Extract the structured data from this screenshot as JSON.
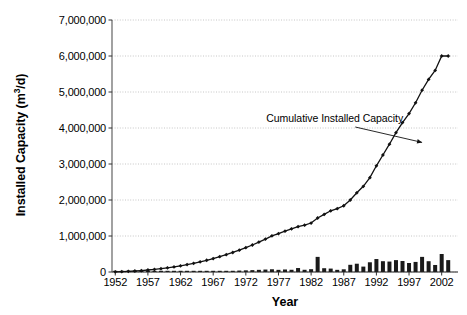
{
  "chart_data": {
    "type": "bar",
    "title": "",
    "xlabel": "Year",
    "ylabel": "Installed Capacity (m3/d)",
    "ylabel_parts": {
      "pre": "Installed Capacity (m",
      "sup": "3",
      "post": "/d)"
    },
    "ylim": [
      0,
      7000000
    ],
    "xlim": [
      1951.5,
      2004.5
    ],
    "grid": true,
    "legend_position": "none",
    "ytick_labels": [
      "0",
      "1,000,000",
      "2,000,000",
      "3,000,000",
      "4,000,000",
      "5,000,000",
      "6,000,000",
      "7,000,000"
    ],
    "ytick_values": [
      0,
      1000000,
      2000000,
      3000000,
      4000000,
      5000000,
      6000000,
      7000000
    ],
    "xtick_labels": [
      "1952",
      "1957",
      "1962",
      "1967",
      "1972",
      "1977",
      "1982",
      "1987",
      "1992",
      "1997",
      "2002"
    ],
    "xtick_values": [
      1952,
      1957,
      1962,
      1967,
      1972,
      1977,
      1982,
      1987,
      1992,
      1997,
      2002
    ],
    "annotations": [
      {
        "text": "Cumulative Installed Capacity",
        "x": 1988.0,
        "y": 4250000,
        "arrow_to_x": 1999.0,
        "arrow_to_y": 3600000
      }
    ],
    "series": [
      {
        "name": "Annual Installed Capacity",
        "type": "bar",
        "color": "#1a1a1a",
        "x": [
          1952,
          1953,
          1954,
          1955,
          1956,
          1957,
          1958,
          1959,
          1960,
          1961,
          1962,
          1963,
          1964,
          1965,
          1966,
          1967,
          1968,
          1969,
          1970,
          1971,
          1972,
          1973,
          1974,
          1975,
          1976,
          1977,
          1978,
          1979,
          1980,
          1981,
          1982,
          1983,
          1984,
          1985,
          1986,
          1987,
          1988,
          1989,
          1990,
          1991,
          1992,
          1993,
          1994,
          1995,
          1996,
          1997,
          1998,
          1999,
          2000,
          2001,
          2002,
          2003
        ],
        "values": [
          2000,
          3000,
          3000,
          4000,
          4000,
          5000,
          6000,
          6000,
          8000,
          9000,
          10000,
          12000,
          14000,
          16000,
          18000,
          22000,
          26000,
          30000,
          34000,
          40000,
          46000,
          52000,
          60000,
          68000,
          76000,
          60000,
          70000,
          62000,
          110000,
          62000,
          78000,
          420000,
          105000,
          95000,
          60000,
          75000,
          200000,
          230000,
          150000,
          270000,
          360000,
          300000,
          290000,
          330000,
          305000,
          250000,
          280000,
          420000,
          300000,
          195000,
          500000,
          330000
        ]
      },
      {
        "name": "Cumulative Installed Capacity",
        "type": "line",
        "color": "#111111",
        "marker": "diamond",
        "x": [
          1952,
          1953,
          1954,
          1955,
          1956,
          1957,
          1958,
          1959,
          1960,
          1961,
          1962,
          1963,
          1964,
          1965,
          1966,
          1967,
          1968,
          1969,
          1970,
          1971,
          1972,
          1973,
          1974,
          1975,
          1976,
          1977,
          1978,
          1979,
          1980,
          1981,
          1982,
          1983,
          1984,
          1985,
          1986,
          1987,
          1988,
          1989,
          1990,
          1991,
          1992,
          1993,
          1994,
          1995,
          1996,
          1997,
          1998,
          1999,
          2000,
          2001,
          2002,
          2003
        ],
        "values": [
          5000,
          10000,
          18000,
          28000,
          40000,
          55000,
          72000,
          92000,
          115000,
          142000,
          172000,
          205000,
          242000,
          282000,
          326000,
          374000,
          426000,
          482000,
          542000,
          606000,
          676000,
          750000,
          830000,
          915000,
          1005000,
          1065000,
          1135000,
          1200000,
          1260000,
          1300000,
          1360000,
          1500000,
          1600000,
          1700000,
          1760000,
          1840000,
          2000000,
          2200000,
          2380000,
          2620000,
          2950000,
          3250000,
          3550000,
          3870000,
          4150000,
          4400000,
          4700000,
          5050000,
          5350000,
          5600000,
          6000000,
          6000000
        ]
      }
    ]
  }
}
